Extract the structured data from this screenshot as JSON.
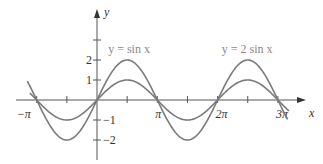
{
  "chart_data": {
    "type": "line",
    "title": "",
    "xlabel": "x",
    "ylabel": "y",
    "xlim": [
      -4.2,
      10.8
    ],
    "ylim": [
      -2.9,
      4.5
    ],
    "grid": false,
    "x_ticks": [
      {
        "value": -3.14159,
        "label": "−π"
      },
      {
        "value": -1.5708,
        "label": ""
      },
      {
        "value": 1.5708,
        "label": ""
      },
      {
        "value": 3.14159,
        "label": "π"
      },
      {
        "value": 4.71239,
        "label": ""
      },
      {
        "value": 6.28319,
        "label": "2π"
      },
      {
        "value": 7.85398,
        "label": ""
      },
      {
        "value": 9.42478,
        "label": "3π"
      }
    ],
    "y_ticks": [
      {
        "value": 3,
        "label": ""
      },
      {
        "value": 2,
        "label": "2"
      },
      {
        "value": 1,
        "label": "1"
      },
      {
        "value": -1,
        "label": "−1"
      },
      {
        "value": -2,
        "label": "−2"
      }
    ],
    "series": [
      {
        "name": "y = sin x",
        "function": "sin",
        "amplitude": 1,
        "x_range": [
          -3.5,
          10.0
        ],
        "color": "#7a7a7a",
        "label": "y = sin x",
        "label_pos": {
          "x": 0.58,
          "y": 2.35
        }
      },
      {
        "name": "y = 2 sin x",
        "function": "sin",
        "amplitude": 2,
        "x_range": [
          -3.63,
          9.93
        ],
        "color": "#7a7a7a",
        "label": "y = 2 sin x",
        "label_pos": {
          "x": 6.5,
          "y": 2.35
        }
      }
    ],
    "sample_points": {
      "x": [
        -3.14159,
        -1.5708,
        0,
        1.5708,
        3.14159,
        4.71239,
        6.28319,
        7.85398,
        9.42478
      ],
      "sin_x": [
        0,
        -1,
        0,
        1,
        0,
        -1,
        0,
        1,
        0
      ],
      "two_sin_x": [
        0,
        -2,
        0,
        2,
        0,
        -2,
        0,
        2,
        0
      ]
    },
    "annotations": [
      "y = sin x",
      "y = 2 sin x"
    ]
  },
  "axes": {
    "x_label": "x",
    "y_label": "y"
  }
}
